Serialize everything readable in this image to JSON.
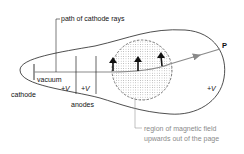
{
  "diagram": {
    "labels": {
      "path": "path of cathode rays",
      "vacuum": "vacuum",
      "cathode": "cathode",
      "anode_v1": "+V",
      "anode_v2": "+V",
      "anodes": "anodes",
      "screen_v": "+V",
      "point": "P",
      "field_line1": "region of magnetic field",
      "field_line2": "upwards out of the page"
    },
    "colors": {
      "outline": "#222222",
      "beam": "#8a8a8a",
      "field_label": "#8a8a8a",
      "dots": "#9a9a9a"
    }
  }
}
